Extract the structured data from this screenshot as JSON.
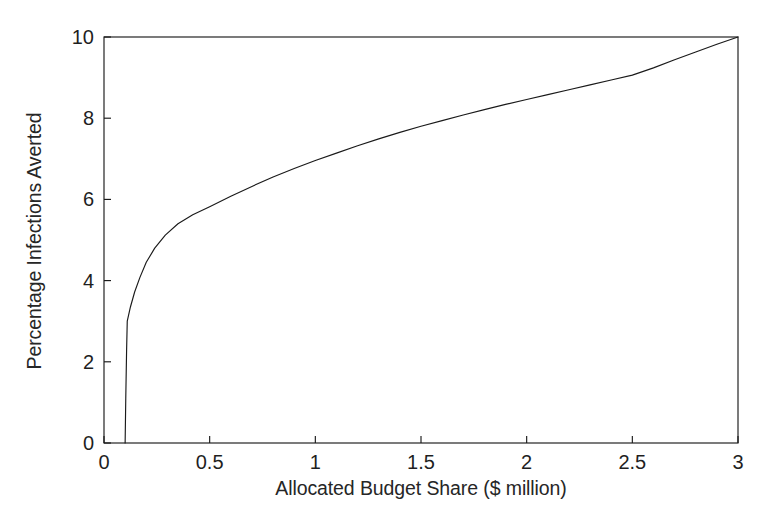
{
  "chart_data": {
    "type": "line",
    "title": "",
    "xlabel": "Allocated Budget Share ($ million)",
    "ylabel": "Percentage Infections Averted",
    "xlim": [
      0,
      3
    ],
    "ylim": [
      0,
      10
    ],
    "xticks": [
      0,
      0.5,
      1,
      1.5,
      2,
      2.5,
      3
    ],
    "xtick_labels": [
      "0",
      "0.5",
      "1",
      "1.5",
      "2",
      "2.5",
      "3"
    ],
    "yticks": [
      0,
      2,
      4,
      6,
      8,
      10
    ],
    "ytick_labels": [
      "0",
      "2",
      "4",
      "6",
      "8",
      "10"
    ],
    "grid": false,
    "legend": null,
    "line_color": "#1a1a1a",
    "background_color": "#ffffff",
    "series": [
      {
        "name": "Percentage infections averted",
        "x": [
          0.1,
          0.103,
          0.107,
          0.11,
          0.125,
          0.145,
          0.17,
          0.2,
          0.24,
          0.29,
          0.35,
          0.42,
          0.5,
          0.6,
          0.7,
          0.8,
          0.9,
          1.0,
          1.1,
          1.2,
          1.3,
          1.4,
          1.5,
          1.6,
          1.7,
          1.8,
          1.9,
          2.0,
          2.1,
          2.2,
          2.3,
          2.4,
          2.5,
          2.6,
          2.7,
          2.8,
          2.9,
          3.0
        ],
        "y": [
          0.0,
          1.1,
          2.3,
          3.0,
          3.35,
          3.72,
          4.08,
          4.45,
          4.8,
          5.12,
          5.4,
          5.62,
          5.82,
          6.08,
          6.32,
          6.55,
          6.76,
          6.96,
          7.14,
          7.32,
          7.49,
          7.65,
          7.8,
          7.94,
          8.08,
          8.21,
          8.34,
          8.46,
          8.58,
          8.7,
          8.82,
          8.94,
          9.06,
          9.24,
          9.44,
          9.63,
          9.82,
          10.0
        ]
      }
    ],
    "annotations": []
  },
  "plot_frame": {
    "left_px": 104,
    "right_px": 738,
    "top_px": 37,
    "bottom_px": 443
  }
}
